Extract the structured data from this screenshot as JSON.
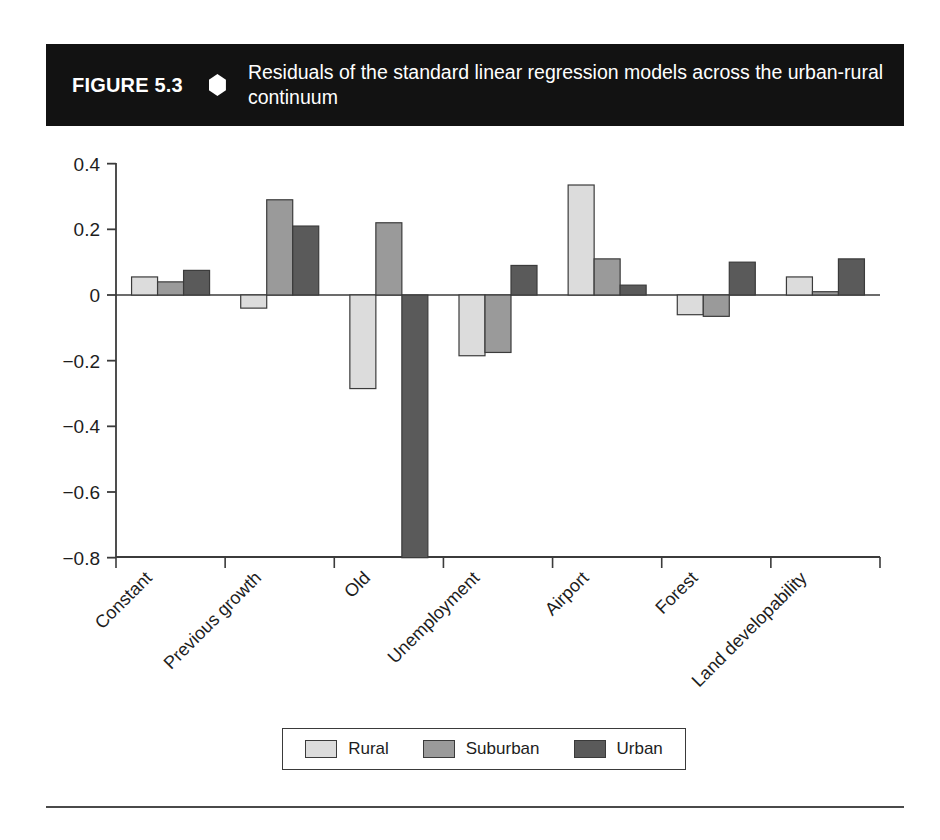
{
  "figure": {
    "number_label": "FIGURE 5.3",
    "diamond_icon": "diamond-bullet-icon",
    "caption": "Residuals of the standard linear regression models across the urban-rural continuum"
  },
  "legend": {
    "position": "bottom-center",
    "entries": [
      {
        "label": "Rural",
        "color": "#dcdcdc"
      },
      {
        "label": "Suburban",
        "color": "#9a9a9a"
      },
      {
        "label": "Urban",
        "color": "#5a5a5a"
      }
    ]
  },
  "chart_data": {
    "type": "bar",
    "title": "Residuals of the standard linear regression models across the urban-rural continuum",
    "xlabel": "",
    "ylabel": "",
    "ylim": [
      -0.8,
      0.4
    ],
    "yticks": [
      0.4,
      0.2,
      0,
      -0.2,
      -0.4,
      -0.6,
      -0.8
    ],
    "ytick_labels": [
      "0.4",
      "0.2",
      "0",
      "−0.2",
      "−0.4",
      "−0.6",
      "−0.8"
    ],
    "grid": false,
    "categories": [
      "Constant",
      "Previous growth",
      "Old",
      "Unemployment",
      "Airport",
      "Forest",
      "Land developability"
    ],
    "series": [
      {
        "name": "Rural",
        "color": "#dcdcdc",
        "values": [
          0.055,
          -0.04,
          -0.285,
          -0.185,
          0.335,
          -0.06,
          0.055
        ]
      },
      {
        "name": "Suburban",
        "color": "#9a9a9a",
        "values": [
          0.04,
          0.29,
          0.22,
          -0.175,
          0.11,
          -0.065,
          0.01
        ]
      },
      {
        "name": "Urban",
        "color": "#5a5a5a",
        "values": [
          0.075,
          0.21,
          -0.8,
          0.09,
          0.03,
          0.1,
          0.11
        ]
      }
    ]
  }
}
